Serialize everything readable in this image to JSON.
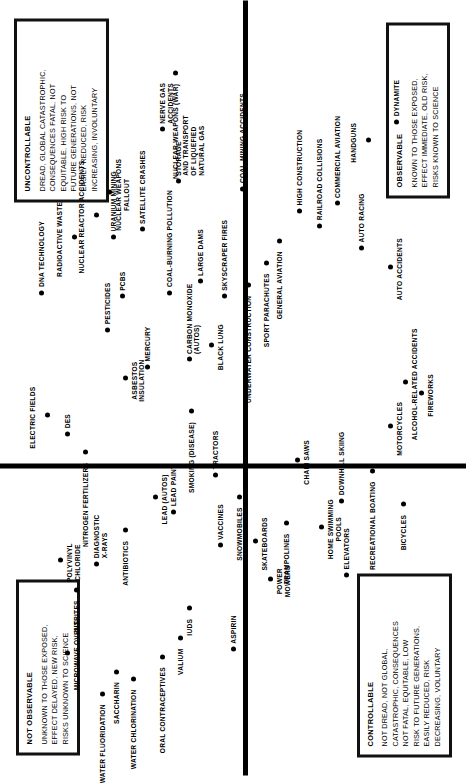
{
  "figure": {
    "axes": {
      "vertical_label_top": "Unobservable / Unknown Risk",
      "vertical_label_bottom": "Observable / Known Risk",
      "horizontal_label_left": "Controllable",
      "horizontal_label_right": "Uncontrollable / Dread Risk"
    }
  },
  "quadrant_boxes": [
    {
      "key": "not_observable",
      "title": "NOT OBSERVABLE",
      "lines": [
        "UNKNOWN TO THOSE EXPOSED,",
        "EFFECT DELAYED, NEW RISK,",
        "RISKS UNKNOWN TO SCIENCE"
      ]
    },
    {
      "key": "uncontrollable",
      "title": "UNCONTROLLABLE",
      "lines": [
        "DREAD, GLOBAL CATASTROPHIC,",
        "CONSEQUENCES FATAL, NOT",
        "EQUITABLE, HIGH RISK TO",
        "FUTURE GENERATIONS, NOT",
        "EASILY REDUCED, RISK",
        "INCREASING, INVOLUNTARY"
      ]
    },
    {
      "key": "controllable",
      "title": "CONTROLLABLE",
      "lines": [
        "NOT DREAD, NOT GLOBAL,",
        "CATASTROPHIC, CONSEQUENCES",
        "NOT FATAL, EQUITABLE, LOW",
        "RISK TO FUTURE GENERATIONS,",
        "EASILY REDUCED, RISK",
        "DECREASING, VOLUNTARY"
      ]
    },
    {
      "key": "observable",
      "title": "OBSERVABLE",
      "lines": [
        "KNOWN TO THOSE EXPOSED,",
        "EFFECT IMMEDIATE, OLD RISK,",
        "RISKS KNOWN TO SCIENCE"
      ]
    }
  ],
  "chart_data": {
    "type": "scatter",
    "xlabel": "Factor 2: Controllable → Uncontrollable (Dread)",
    "ylabel": "Factor 1: Observable → Not Observable (Unknown)",
    "xlim": [
      0,
      100
    ],
    "ylim": [
      0,
      100
    ],
    "grid": false,
    "legend": "none",
    "quadrants": [
      "upper-left: not observable / controllable",
      "upper-right: not observable / uncontrollable",
      "lower-left: observable / controllable",
      "lower-right: observable / uncontrollable"
    ],
    "points": [
      {
        "label": "MICROWAVE OVENS",
        "x": 14.0,
        "y": 88.0
      },
      {
        "label": "WATER FLUORIDATION",
        "x": 8.5,
        "y": 80.0
      },
      {
        "label": "SACCHARIN",
        "x": 11.5,
        "y": 77.0
      },
      {
        "label": "WATER CHLORINATION",
        "x": 10.5,
        "y": 73.0
      },
      {
        "label": "ORAL CONTRACEPTIVES",
        "x": 13.5,
        "y": 66.5
      },
      {
        "label": "VALIUM",
        "x": 16.0,
        "y": 62.5
      },
      {
        "label": "IUDS",
        "x": 20.0,
        "y": 60.5
      },
      {
        "label": "NITRITES",
        "x": 22.5,
        "y": 86.0
      },
      {
        "label": "POLYVINYL\nCHLORIDE",
        "x": 26.5,
        "y": 89.5
      },
      {
        "label": "DIAGNOSTIC\nX-RAYS",
        "x": 26.0,
        "y": 81.5
      },
      {
        "label": "ANTIBIOTICS",
        "x": 30.5,
        "y": 75.0
      },
      {
        "label": "LEAD (AUTOS)",
        "x": 35.0,
        "y": 68.0
      },
      {
        "label": "LEAD PAINT",
        "x": 33.0,
        "y": 64.0
      },
      {
        "label": "VACCINES",
        "x": 28.5,
        "y": 53.5
      },
      {
        "label": "ASPIRIN",
        "x": 14.5,
        "y": 50.5
      },
      {
        "label": "ELECTRIC FIELDS",
        "x": 46.0,
        "y": 92.5
      },
      {
        "label": "DES",
        "x": 43.5,
        "y": 88.0
      },
      {
        "label": "NITROGEN FERTILIZERS",
        "x": 41.0,
        "y": 84.0
      },
      {
        "label": "DNA TECHNOLOGY",
        "x": 62.5,
        "y": 94.0
      },
      {
        "label": "RADIOACTIVE WASTE",
        "x": 70.0,
        "y": 86.5
      },
      {
        "label": "NUCLEAR REACTOR ACCIDENTS",
        "x": 73.0,
        "y": 81.5
      },
      {
        "label": "URANIUM MINING",
        "x": 70.0,
        "y": 77.5
      },
      {
        "label": "NUCLEAR WEAPONS\nFALLOUT",
        "x": 76.0,
        "y": 78.5
      },
      {
        "label": "PESTICIDES",
        "x": 57.5,
        "y": 79.0
      },
      {
        "label": "ASBESTOS\nINSULATION",
        "x": 51.0,
        "y": 75.0
      },
      {
        "label": "PCBS",
        "x": 62.0,
        "y": 75.5
      },
      {
        "label": "SATELLITE CRASHES",
        "x": 71.0,
        "y": 71.0
      },
      {
        "label": "MERCURY",
        "x": 52.5,
        "y": 70.0
      },
      {
        "label": "COAL-BURNING POLLUTION",
        "x": 62.5,
        "y": 65.0
      },
      {
        "label": "SMOKING (DISEASE)",
        "x": 46.5,
        "y": 60.0
      },
      {
        "label": "TRACTORS",
        "x": 38.0,
        "y": 54.5
      },
      {
        "label": "SNOWMOBILES",
        "x": 35.0,
        "y": 49.0
      },
      {
        "label": "SKATEBOARDS",
        "x": 29.0,
        "y": 45.5
      },
      {
        "label": "POWER\nMOWERS",
        "x": 24.0,
        "y": 42.0
      },
      {
        "label": "TRAMPOLINES",
        "x": 31.5,
        "y": 38.5
      },
      {
        "label": "CHAIN SAWS",
        "x": 40.0,
        "y": 36.0
      },
      {
        "label": "HOME SWIMMING\nPOOLS",
        "x": 31.0,
        "y": 30.5
      },
      {
        "label": "ELEVATORS",
        "x": 24.5,
        "y": 25.0
      },
      {
        "label": "DOWNHILL SKIING",
        "x": 34.5,
        "y": 26.0
      },
      {
        "label": "RECREATIONAL BOATING",
        "x": 38.5,
        "y": 19.0
      },
      {
        "label": "BICYCLES",
        "x": 34.0,
        "y": 12.0
      },
      {
        "label": "MOTORCYCLES",
        "x": 44.5,
        "y": 15.0
      },
      {
        "label": "ALCOHOL-RELATED ACCIDENTS",
        "x": 50.5,
        "y": 11.5
      },
      {
        "label": "FIREWORKS",
        "x": 49.0,
        "y": 8.0
      },
      {
        "label": "CARBON MONOXIDE\n(AUTOS)",
        "x": 53.5,
        "y": 60.5
      },
      {
        "label": "BLACK LUNG",
        "x": 55.5,
        "y": 55.5
      },
      {
        "label": "LARGE DAMS",
        "x": 64.0,
        "y": 58.0
      },
      {
        "label": "SKYSCRAPER FIRES",
        "x": 62.0,
        "y": 52.5
      },
      {
        "label": "STORAGE\nAND TRANSPORT\nOF LIQUEFIED\nNATURAL GAS",
        "x": 77.5,
        "y": 63.0
      },
      {
        "label": "NERVE GAS\nACCIDENTS",
        "x": 84.5,
        "y": 66.5
      },
      {
        "label": "NUCLEAR WEAPONS (WAR)",
        "x": 92.0,
        "y": 63.5
      },
      {
        "label": "COAL-MINING ACCIDENTS",
        "x": 76.5,
        "y": 48.5
      },
      {
        "label": "UNDERWATER CONSTRUCTION",
        "x": 63.5,
        "y": 47.0
      },
      {
        "label": "SPORT PARACHUTES",
        "x": 66.5,
        "y": 43.0
      },
      {
        "label": "GENERAL AVIATION",
        "x": 69.5,
        "y": 40.0
      },
      {
        "label": "HIGH CONSTRUCTION",
        "x": 73.5,
        "y": 35.5
      },
      {
        "label": "RAILROAD COLLISIONS",
        "x": 71.5,
        "y": 31.0
      },
      {
        "label": "COMMERCIAL AVIATION",
        "x": 74.5,
        "y": 27.0
      },
      {
        "label": "AUTO RACING",
        "x": 68.5,
        "y": 21.5
      },
      {
        "label": "AUTO ACCIDENTS",
        "x": 66.0,
        "y": 15.0
      },
      {
        "label": "HANDGUNS",
        "x": 83.0,
        "y": 20.0
      },
      {
        "label": "DYNAMITE",
        "x": 85.5,
        "y": 13.5
      }
    ]
  }
}
